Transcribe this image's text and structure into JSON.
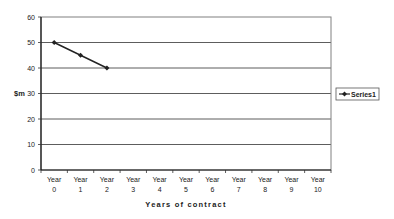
{
  "chart_data": {
    "type": "line",
    "title": "",
    "xlabel": "Years of contract",
    "ylabel": "$m",
    "categories": [
      "Year 0",
      "Year 1",
      "Year 2",
      "Year 3",
      "Year 4",
      "Year 5",
      "Year 6",
      "Year 7",
      "Year 8",
      "Year 9",
      "Year 10"
    ],
    "category_lines": [
      [
        "Year",
        "0"
      ],
      [
        "Year",
        "1"
      ],
      [
        "Year",
        "2"
      ],
      [
        "Year",
        "3"
      ],
      [
        "Year",
        "4"
      ],
      [
        "Year",
        "5"
      ],
      [
        "Year",
        "6"
      ],
      [
        "Year",
        "7"
      ],
      [
        "Year",
        "8"
      ],
      [
        "Year",
        "9"
      ],
      [
        "Year",
        "10"
      ]
    ],
    "series": [
      {
        "name": "Series1",
        "values": [
          50,
          45,
          40,
          null,
          null,
          null,
          null,
          null,
          null,
          null,
          null
        ],
        "color": "#222222",
        "marker": "diamond"
      }
    ],
    "ylim": [
      0,
      60
    ],
    "yticks": [
      0,
      10,
      20,
      30,
      40,
      50,
      60
    ],
    "grid": true,
    "legend_position": "right"
  }
}
